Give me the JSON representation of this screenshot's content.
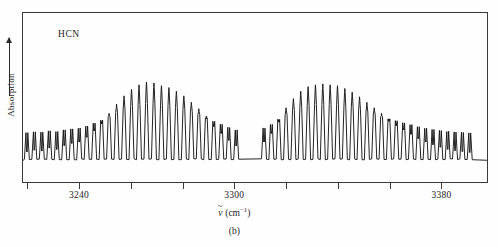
{
  "figure": {
    "caption": "(b)",
    "molecule_label": "HCN",
    "y_axis_label": "Absorption",
    "x_axis_title_symbol": "v",
    "x_axis_title_units_open": " (cm",
    "x_axis_title_units_exp": "−1",
    "x_axis_title_units_close": ")",
    "frame_color": "#3a3a3a",
    "trace_color": "#161616",
    "background_color": "#fefefe"
  },
  "chart_data": {
    "type": "line",
    "title": "HCN",
    "subtitle": "(b)",
    "xlabel": "ỹ (cm⁻¹)",
    "ylabel": "Absorption",
    "xlim": [
      3218,
      3398
    ],
    "ylim": [
      0,
      1
    ],
    "grid": false,
    "legend": null,
    "y_axis_ticks_shown": false,
    "y_axis_direction_arrow": "up",
    "x_tick_values": [
      3220,
      3240,
      3260,
      3280,
      3300,
      3320,
      3340,
      3360,
      3380
    ],
    "x_tick_labels_shown": [
      "3240",
      "3300",
      "3380"
    ],
    "x_tick_interval": 20,
    "px_per_wavenumber": 2.707,
    "branches": [
      {
        "name": "P branch",
        "x_range": [
          3219,
          3302
        ],
        "line_spacing": 2.9,
        "envelope_peak_x": 3268,
        "envelope_max_intensity": 0.84
      },
      {
        "name": "R branch",
        "x_range": [
          3311,
          3394
        ],
        "line_spacing": 2.85,
        "envelope_peak_x": 3340,
        "envelope_max_intensity": 0.82
      }
    ],
    "band_gap": {
      "x_range": [
        3302,
        3311
      ],
      "description": "Missing Q branch region between P and R branches"
    },
    "series": [
      {
        "name": "P branch lines",
        "x": [
          3219.5,
          3222.4,
          3225.3,
          3228.2,
          3231.1,
          3234.0,
          3236.9,
          3239.8,
          3242.7,
          3245.6,
          3248.5,
          3251.4,
          3254.3,
          3257.2,
          3260.1,
          3263.0,
          3265.9,
          3268.8,
          3271.7,
          3274.6,
          3277.5,
          3280.4,
          3283.3,
          3286.2,
          3289.1,
          3292.0,
          3294.9,
          3297.8,
          3300.7
        ],
        "values": [
          0.085,
          0.105,
          0.095,
          0.13,
          0.115,
          0.16,
          0.185,
          0.2,
          0.255,
          0.33,
          0.41,
          0.5,
          0.6,
          0.69,
          0.76,
          0.81,
          0.84,
          0.83,
          0.8,
          0.78,
          0.74,
          0.69,
          0.62,
          0.55,
          0.47,
          0.38,
          0.3,
          0.22,
          0.155
        ]
      },
      {
        "name": "R branch lines",
        "x": [
          3311.5,
          3314.35,
          3317.2,
          3320.05,
          3322.9,
          3325.75,
          3328.6,
          3331.45,
          3334.3,
          3337.15,
          3340.0,
          3342.85,
          3345.7,
          3348.55,
          3351.4,
          3354.25,
          3357.1,
          3359.95,
          3362.8,
          3365.65,
          3368.5,
          3371.35,
          3374.2,
          3377.05,
          3379.9,
          3382.75,
          3385.6,
          3388.45,
          3391.3
        ],
        "values": [
          0.2,
          0.3,
          0.43,
          0.56,
          0.66,
          0.74,
          0.79,
          0.81,
          0.82,
          0.81,
          0.8,
          0.77,
          0.73,
          0.68,
          0.62,
          0.56,
          0.5,
          0.44,
          0.39,
          0.34,
          0.29,
          0.24,
          0.2,
          0.17,
          0.14,
          0.115,
          0.1,
          0.09,
          0.08
        ]
      }
    ]
  }
}
